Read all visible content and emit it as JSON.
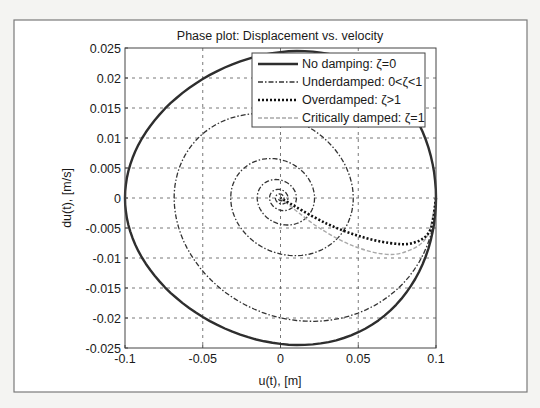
{
  "chart_data": {
    "type": "line",
    "title": "Phase plot: Displacement vs. velocity",
    "xlabel": "u(t), [m]",
    "ylabel": "du(t), [m/s]",
    "xlim": [
      -0.1,
      0.1
    ],
    "ylim": [
      -0.025,
      0.025
    ],
    "grid": true,
    "legend_position": "upper right",
    "xticks": [
      "-0.1",
      "-0.05",
      "0",
      "0.05",
      "0.1"
    ],
    "yticks": [
      "0.025",
      "0.02",
      "0.015",
      "0.01",
      "0.005",
      "0",
      "-0.005",
      "-0.01",
      "-0.015",
      "-0.02",
      "-0.025"
    ],
    "series": [
      {
        "name": "No damping: ζ=0",
        "style": "solid",
        "color": "#333333",
        "description": "closed ellipse through (±0.1, 0) and (0, ±0.0245)",
        "u_amplitude": 0.1,
        "v_amplitude": 0.0245
      },
      {
        "name": "Underdamped: 0<ζ<1",
        "style": "dash-dot",
        "color": "#333333",
        "description": "inward spiral from (0.1, 0) to origin",
        "points": [
          [
            0.1,
            0
          ],
          [
            0.04,
            -0.018
          ],
          [
            -0.05,
            -0.005
          ],
          [
            -0.01,
            0.01
          ],
          [
            0.028,
            -0.0
          ],
          [
            0.01,
            -0.005
          ],
          [
            -0.007,
            0.003
          ],
          [
            0.006,
            0.0006
          ],
          [
            0,
            0
          ]
        ]
      },
      {
        "name": "Overdamped: ζ>1",
        "style": "dotted",
        "color": "#111111",
        "description": "from (0.1, 0) dipping to ~-0.0075 then to origin",
        "points": [
          [
            0.1,
            0
          ],
          [
            0.096,
            -0.0055
          ],
          [
            0.085,
            -0.0075
          ],
          [
            0.07,
            -0.0075
          ],
          [
            0.05,
            -0.0063
          ],
          [
            0.03,
            -0.0043
          ],
          [
            0.01,
            -0.0015
          ],
          [
            0,
            0
          ]
        ]
      },
      {
        "name": "Critically damped: ζ=1",
        "style": "dashed",
        "color": "#aaaaaa",
        "description": "from (0.1, 0) dipping to ~-0.0093 then to origin",
        "points": [
          [
            0.1,
            0
          ],
          [
            0.094,
            -0.0065
          ],
          [
            0.08,
            -0.009
          ],
          [
            0.065,
            -0.0093
          ],
          [
            0.045,
            -0.0078
          ],
          [
            0.025,
            -0.005
          ],
          [
            0.008,
            -0.0017
          ],
          [
            0,
            0
          ]
        ]
      }
    ]
  }
}
